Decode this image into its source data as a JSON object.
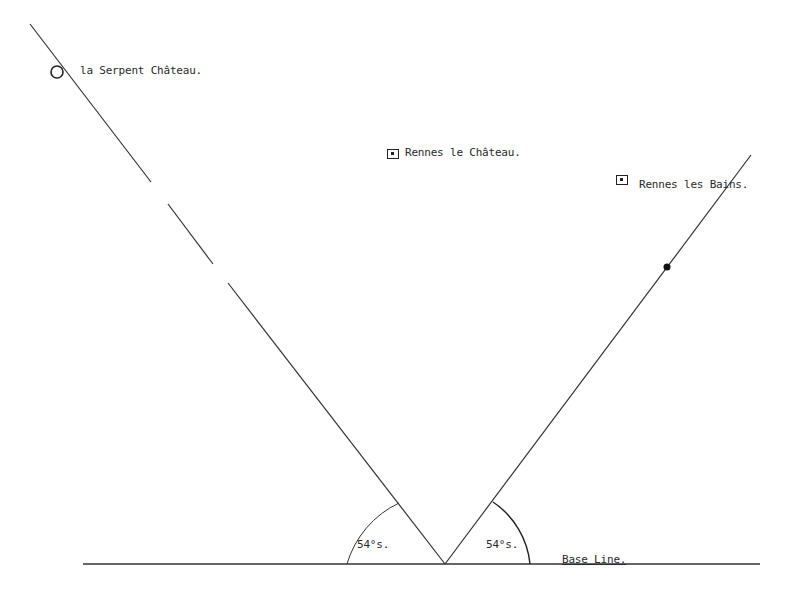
{
  "diagram": {
    "labels": {
      "serpent": "la Serpent Château.",
      "rennes_chateau": "Rennes le Château.",
      "rennes_bains": "Rennes les Bains.",
      "angle_left": "54°s.",
      "angle_right": "54°s.",
      "base_line": "Base Line."
    },
    "markers": {
      "serpent": "open-circle",
      "rennes_chateau": "boxed-square",
      "rennes_bains": "boxed-square",
      "right_line_point": "filled-dot"
    },
    "angles_degrees": [
      54,
      54
    ],
    "colors": {
      "ink": "#222222",
      "background": "#ffffff"
    }
  }
}
